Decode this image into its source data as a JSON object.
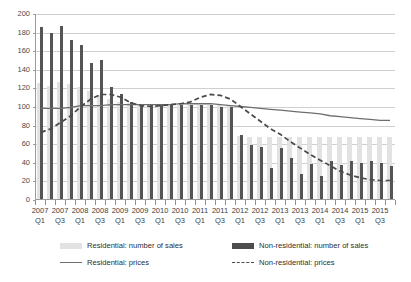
{
  "chart_data": {
    "type": "bar",
    "title": "",
    "xlabel": "",
    "ylabel": "",
    "ylim": [
      0,
      200
    ],
    "yticks": [
      0,
      20,
      40,
      60,
      80,
      100,
      120,
      140,
      160,
      180,
      200
    ],
    "grid": true,
    "legend_position": "bottom",
    "categories": [
      "2007 Q1",
      "2007 Q2",
      "2007 Q3",
      "2007 Q4",
      "2008 Q1",
      "2008 Q2",
      "2008 Q3",
      "2008 Q4",
      "2009 Q1",
      "2009 Q2",
      "2009 Q3",
      "2009 Q4",
      "2010 Q1",
      "2010 Q2",
      "2010 Q3",
      "2010 Q4",
      "2011 Q1",
      "2011 Q2",
      "2011 Q3",
      "2011 Q4",
      "2012 Q1",
      "2012 Q2",
      "2012 Q3",
      "2012 Q4",
      "2013 Q1",
      "2013 Q2",
      "2013 Q3",
      "2013 Q4",
      "2014 Q1",
      "2014 Q2",
      "2014 Q3",
      "2014 Q4",
      "2015 Q1",
      "2015 Q2",
      "2015 Q3",
      "2015 Q4"
    ],
    "tick_labels": [
      {
        "index": 0,
        "year": "2007",
        "quarter": "Q1"
      },
      {
        "index": 2,
        "year": "2007",
        "quarter": "Q3"
      },
      {
        "index": 4,
        "year": "2008",
        "quarter": "Q1"
      },
      {
        "index": 6,
        "year": "2008",
        "quarter": "Q3"
      },
      {
        "index": 8,
        "year": "2009",
        "quarter": "Q1"
      },
      {
        "index": 10,
        "year": "2009",
        "quarter": "Q3"
      },
      {
        "index": 12,
        "year": "2010",
        "quarter": "Q1"
      },
      {
        "index": 14,
        "year": "2010",
        "quarter": "Q3"
      },
      {
        "index": 16,
        "year": "2011",
        "quarter": "Q1"
      },
      {
        "index": 18,
        "year": "2011",
        "quarter": "Q3"
      },
      {
        "index": 20,
        "year": "2012",
        "quarter": "Q1"
      },
      {
        "index": 22,
        "year": "2012",
        "quarter": "Q3"
      },
      {
        "index": 24,
        "year": "2013",
        "quarter": "Q1"
      },
      {
        "index": 26,
        "year": "2013",
        "quarter": "Q3"
      },
      {
        "index": 28,
        "year": "2014",
        "quarter": "Q1"
      },
      {
        "index": 30,
        "year": "2014",
        "quarter": "Q3"
      },
      {
        "index": 32,
        "year": "2015",
        "quarter": "Q1"
      },
      {
        "index": 34,
        "year": "2015",
        "quarter": "Q3"
      }
    ],
    "series": [
      {
        "name": "Residential: number of sales",
        "kind": "bar",
        "color": "#e2e2e2",
        "values": [
          125,
          122,
          126,
          124,
          120,
          116,
          112,
          108,
          104,
          103,
          102,
          101,
          101,
          101,
          101,
          101,
          101,
          101,
          101,
          101,
          68,
          67,
          67,
          67,
          67,
          67,
          67,
          67,
          67,
          67,
          67,
          67,
          67,
          67,
          67,
          67
        ]
      },
      {
        "name": "Non-residential: number of sales",
        "kind": "bar",
        "color": "#555555",
        "values": [
          185,
          179,
          186,
          171,
          166,
          146,
          149,
          120,
          113,
          104,
          102,
          101,
          101,
          101,
          101,
          101,
          101,
          101,
          99,
          99,
          69,
          58,
          56,
          33,
          55,
          44,
          27,
          38,
          25,
          41,
          37,
          41,
          39,
          41,
          39,
          36
        ]
      },
      {
        "name": "Residential: prices",
        "kind": "line",
        "style": "solid",
        "color": "#6e6e6e",
        "values": [
          98,
          98,
          98,
          99,
          101,
          101,
          101,
          102,
          102,
          102,
          102,
          102,
          102,
          102,
          103,
          103,
          103,
          103,
          102,
          101,
          100,
          99,
          98,
          97,
          96,
          95,
          94,
          93,
          92,
          90,
          89,
          88,
          87,
          86,
          85,
          85
        ]
      },
      {
        "name": "Non-residential: prices",
        "kind": "line",
        "style": "dashed",
        "color": "#4a4a4a",
        "values": [
          72,
          76,
          83,
          90,
          100,
          108,
          113,
          113,
          110,
          104,
          101,
          100,
          101,
          102,
          103,
          105,
          110,
          113,
          112,
          108,
          100,
          92,
          84,
          76,
          70,
          62,
          55,
          48,
          42,
          36,
          30,
          26,
          23,
          21,
          20,
          20
        ]
      }
    ]
  },
  "legend": {
    "items": [
      {
        "label": "Residential: number of sales",
        "swatch": "res-bar"
      },
      {
        "label": "Non-residential: number of sales",
        "swatch": "non-bar"
      },
      {
        "label": "Residential: prices",
        "swatch": "res-line"
      },
      {
        "label": "Non-residential: prices",
        "swatch": "non-line"
      }
    ]
  },
  "colors": {
    "residential_bar": "#e2e2e2",
    "nonresidential_bar": "#555555",
    "residential_line": "#6e6e6e",
    "nonresidential_line": "#4a4a4a",
    "gridline": "#cfcfcf",
    "axis": "#9a9a9a"
  }
}
